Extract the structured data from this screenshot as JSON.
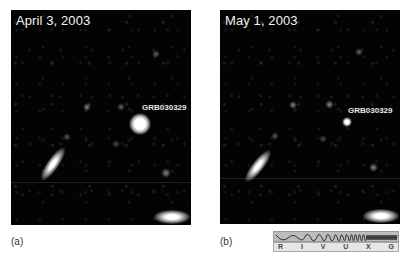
{
  "figure": {
    "panels": [
      {
        "id": "a",
        "date_label": "April 3, 2003",
        "object_label": "GRB030329",
        "caption": "(a)"
      },
      {
        "id": "b",
        "date_label": "May 1, 2003",
        "object_label": "GRB030329",
        "caption": "(b)"
      }
    ],
    "spectrum_bar": {
      "bands": [
        "R",
        "I",
        "V",
        "U",
        "X",
        "G"
      ]
    }
  }
}
